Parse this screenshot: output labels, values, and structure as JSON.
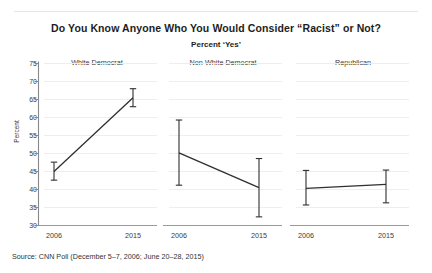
{
  "title": "Do You Know Anyone Who You Would Consider “Racist” or Not?",
  "subtitle": "Percent ‘Yes’",
  "source": "Source: CNN Poll (December 5–7, 2006; June 20–28, 2015)",
  "axis": {
    "ylabel": "Percent",
    "yticks": [
      "30",
      "35",
      "40",
      "45",
      "50",
      "55",
      "60",
      "65",
      "70",
      "75"
    ],
    "xticks": [
      "2006",
      "2015"
    ]
  },
  "panels": [
    {
      "label": "White Democrat"
    },
    {
      "label": "Non-White Democrat"
    },
    {
      "label": "Republican"
    }
  ],
  "colors": {
    "line": "#2f2f2f",
    "grid": "#eeeeee",
    "axis": "#888888",
    "text": "#3a3a3a"
  },
  "chart_data": {
    "type": "line",
    "title": "Do You Know Anyone Who You Would Consider “Racist” or Not?",
    "subtitle": "Percent ‘Yes’",
    "xlabel": "",
    "ylabel": "Percent",
    "ylim": [
      30,
      75
    ],
    "ytick_step": 5,
    "grid": true,
    "legend": "none",
    "layout": "three side-by-side panels sharing one y-axis",
    "x": [
      "2006",
      "2015"
    ],
    "error_bars": true,
    "panels": [
      {
        "name": "White Democrat",
        "values": [
          45.0,
          65.5
        ],
        "error_low": [
          42.6,
          63.0
        ],
        "error_high": [
          47.6,
          68.0
        ]
      },
      {
        "name": "Non-White Democrat",
        "values": [
          50.2,
          40.5
        ],
        "error_low": [
          41.2,
          32.4
        ],
        "error_high": [
          59.3,
          48.6
        ]
      },
      {
        "name": "Republican",
        "values": [
          40.3,
          41.4
        ],
        "error_low": [
          35.7,
          36.3
        ],
        "error_high": [
          45.3,
          45.4
        ]
      }
    ],
    "source": "Source: CNN Poll (December 5–7, 2006; June 20–28, 2015)"
  }
}
